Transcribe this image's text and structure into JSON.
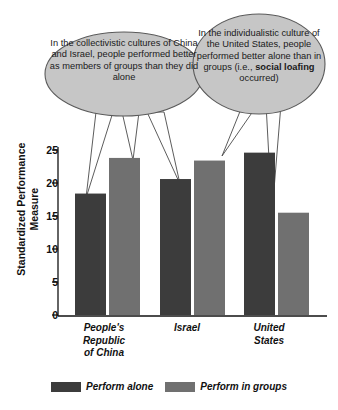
{
  "annotations": {
    "left_bubble": {
      "name": "collectivistic-callout",
      "text": "In the collectivistic cultures of China and Israel, people performed better as members of groups than they did alone",
      "fill": "#c6c6c6",
      "stroke": "#5a5a5a",
      "points_to": [
        "China - Perform alone",
        "China - Perform in groups",
        "Israel - Perform alone"
      ]
    },
    "right_bubble": {
      "name": "individualistic-callout",
      "text_before": "In the individualistic culture of the United States, people performed better alone than in groups (i.e., ",
      "bold_term": "social loafing",
      "text_after": " occurred)",
      "fill": "#c6c6c6",
      "stroke": "#5a5a5a",
      "points_to": [
        "United States - Perform alone",
        "United States - Perform in groups"
      ]
    }
  },
  "chart_data": {
    "type": "bar",
    "title": "",
    "xlabel": "",
    "ylabel": "Standardized Performance Measure",
    "categories": [
      "People's Republic of China",
      "Israel",
      "United States"
    ],
    "category_lines": [
      [
        "People's",
        "Republic",
        "of China"
      ],
      [
        "Israel"
      ],
      [
        "United",
        "States"
      ]
    ],
    "series": [
      {
        "name": "Perform alone",
        "color": "#3c3c3c",
        "values": [
          18.4,
          20.6,
          24.6
        ]
      },
      {
        "name": "Perform in groups",
        "color": "#707070",
        "values": [
          23.8,
          23.4,
          15.5
        ]
      }
    ],
    "ylim": [
      0,
      25
    ],
    "yticks": [
      0,
      5,
      10,
      15,
      20,
      25
    ],
    "ytick_labels": [
      "0",
      "5",
      "10",
      "15",
      "20",
      "25"
    ],
    "grid": false,
    "legend_position": "bottom"
  },
  "legend": {
    "items": [
      {
        "label": "Perform alone",
        "color": "#3c3c3c"
      },
      {
        "label": "Perform in groups",
        "color": "#707070"
      }
    ]
  },
  "axes": {
    "axis_color": "#111111",
    "background": "#ffffff"
  }
}
